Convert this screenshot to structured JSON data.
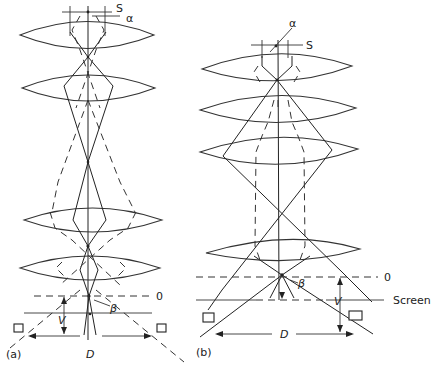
{
  "figure": {
    "panels": [
      {
        "id": "a",
        "label": "(a)",
        "lens_count": 4,
        "labels": {
          "source": "S",
          "aperture_angle": "α",
          "convergence_angle": "β",
          "object_plane": "0",
          "distance": "V",
          "detector_span": "D"
        }
      },
      {
        "id": "b",
        "label": "(b)",
        "lens_count": 4,
        "labels": {
          "source": "S",
          "aperture_angle": "α",
          "convergence_angle": "β",
          "object_plane": "0",
          "distance": "V",
          "detector_span": "D",
          "screen": "Screen"
        }
      }
    ],
    "colors": {
      "background": "#ffffff",
      "line": "#222222"
    }
  }
}
